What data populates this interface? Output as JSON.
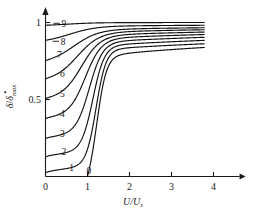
{
  "chart_data": {
    "type": "line",
    "title": "",
    "xlabel": "U/Us",
    "xlabel_main": "U/U",
    "xlabel_sub": "s",
    "ylabel": "δ/δ̇max",
    "ylabel_num": "δ",
    "ylabel_slash": "/",
    "ylabel_den": "δ",
    "ylabel_den_sub": "max",
    "xlim": [
      0,
      4.45
    ],
    "ylim": [
      0,
      1.08
    ],
    "xticks": [
      0,
      1,
      2,
      3,
      4
    ],
    "xticklabels": [
      "0",
      "1",
      "2",
      "3",
      "4"
    ],
    "yticks": [
      0.5,
      1
    ],
    "yticklabels": [
      "0.5",
      "1"
    ],
    "grid": false,
    "legend": "inline-curve-labels",
    "x_axis_arrow": true,
    "y_axis_arrow": true,
    "x_data_max": 3.78,
    "series": [
      {
        "name": "0",
        "label": "0",
        "y_intercept": 0.0,
        "x_start": 1.0,
        "y_end": 0.838,
        "label_x": 1.03,
        "label_y": 0.035,
        "leader": false
      },
      {
        "name": "1",
        "label": "1",
        "y_intercept": 0.022,
        "x_start": 0.0,
        "y_end": 0.862,
        "label_x": 0.62,
        "label_y": 0.055,
        "leader": false
      },
      {
        "name": "2",
        "label": "2",
        "y_intercept": 0.125,
        "x_start": 0.0,
        "y_end": 0.884,
        "label_x": 0.44,
        "label_y": 0.158,
        "leader": false
      },
      {
        "name": "3",
        "label": "3",
        "y_intercept": 0.245,
        "x_start": 0.0,
        "y_end": 0.904,
        "label_x": 0.4,
        "label_y": 0.278,
        "leader": false
      },
      {
        "name": "4",
        "label": "4",
        "y_intercept": 0.375,
        "x_start": 0.0,
        "y_end": 0.922,
        "label_x": 0.4,
        "label_y": 0.408,
        "leader": false
      },
      {
        "name": "5",
        "label": "5",
        "y_intercept": 0.505,
        "x_start": 0.0,
        "y_end": 0.938,
        "label_x": 0.4,
        "label_y": 0.54,
        "leader": false
      },
      {
        "name": "6",
        "label": "6",
        "y_intercept": 0.633,
        "x_start": 0.0,
        "y_end": 0.953,
        "label_x": 0.4,
        "label_y": 0.665,
        "leader": false
      },
      {
        "name": "7",
        "label": "7",
        "y_intercept": 0.752,
        "x_start": 0.0,
        "y_end": 0.966,
        "label_x": 0.33,
        "label_y": 0.79,
        "leader": false
      },
      {
        "name": "8",
        "label": "8",
        "y_intercept": 0.884,
        "x_start": 0.0,
        "y_end": 0.982,
        "label_x": 0.42,
        "label_y": 0.878,
        "leader": true
      },
      {
        "name": "9",
        "label": "9",
        "y_intercept": 0.982,
        "x_start": 0.0,
        "y_end": 1.0,
        "label_x": 0.44,
        "label_y": 0.995,
        "leader": true
      }
    ]
  }
}
